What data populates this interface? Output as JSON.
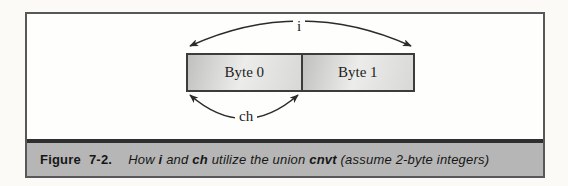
{
  "diagram": {
    "byte0_label": "Byte 0",
    "byte1_label": "Byte 1",
    "arrow_i_label": "i",
    "arrow_ch_label": "ch"
  },
  "caption": {
    "figure_label": "Figure",
    "figure_number": "7-2.",
    "segments": [
      {
        "text": "How ",
        "emphasis": "italic"
      },
      {
        "text": "i",
        "emphasis": "bold-italic"
      },
      {
        "text": " and ",
        "emphasis": "italic"
      },
      {
        "text": "ch",
        "emphasis": "bold-italic"
      },
      {
        "text": " utilize the union ",
        "emphasis": "italic"
      },
      {
        "text": "cnvt",
        "emphasis": "bold-italic"
      },
      {
        "text": " (assume 2-byte integers)",
        "emphasis": "italic"
      }
    ]
  },
  "colors": {
    "caption_background": "#b6b6b6",
    "frame_border": "#58585a",
    "separator_bar": "#2f2f2f",
    "box_border": "#3c3c3c",
    "arrow": "#2b2b2b",
    "text": "#1a1a1a"
  }
}
